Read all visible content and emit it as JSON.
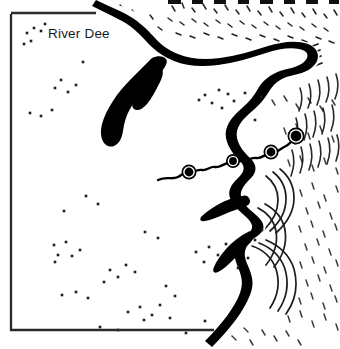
{
  "map": {
    "title_fragment": "",
    "labels": [
      {
        "text": "River Dee",
        "x": 48,
        "y": 38
      }
    ],
    "colors": {
      "ink": "#000000",
      "land": "#ffffff",
      "sea": "#ffffff",
      "frame": "#2b2b2b",
      "site_dot": "#1f1f1f"
    },
    "frame": {
      "x": 11,
      "y": 12,
      "right": 332,
      "bottom": 330
    },
    "legend": {
      "site_marker_name": "settlement-dot",
      "river_marker_name": "river-site-marker"
    },
    "river_markers": [
      {
        "id": 1,
        "x": 189,
        "y": 172,
        "r": 7.5
      },
      {
        "id": 2,
        "x": 233,
        "y": 161,
        "r": 7.0
      },
      {
        "id": 3,
        "x": 271,
        "y": 152,
        "r": 7.5
      },
      {
        "id": 4,
        "x": 296,
        "y": 136,
        "r": 8.5
      }
    ],
    "site_dots": [
      {
        "x": 27,
        "y": 33
      },
      {
        "x": 34,
        "y": 28
      },
      {
        "x": 41,
        "y": 31
      },
      {
        "x": 31,
        "y": 41
      },
      {
        "x": 45,
        "y": 24
      },
      {
        "x": 24,
        "y": 44
      },
      {
        "x": 83,
        "y": 62
      },
      {
        "x": 61,
        "y": 80
      },
      {
        "x": 76,
        "y": 85
      },
      {
        "x": 55,
        "y": 88
      },
      {
        "x": 68,
        "y": 92
      },
      {
        "x": 30,
        "y": 113
      },
      {
        "x": 41,
        "y": 116
      },
      {
        "x": 52,
        "y": 110
      },
      {
        "x": 205,
        "y": 95
      },
      {
        "x": 219,
        "y": 90
      },
      {
        "x": 228,
        "y": 94
      },
      {
        "x": 212,
        "y": 103
      },
      {
        "x": 234,
        "y": 101
      },
      {
        "x": 199,
        "y": 100
      },
      {
        "x": 222,
        "y": 108
      },
      {
        "x": 245,
        "y": 93
      },
      {
        "x": 261,
        "y": 97
      },
      {
        "x": 255,
        "y": 120
      },
      {
        "x": 54,
        "y": 245
      },
      {
        "x": 66,
        "y": 242
      },
      {
        "x": 80,
        "y": 250
      },
      {
        "x": 58,
        "y": 255
      },
      {
        "x": 72,
        "y": 256
      },
      {
        "x": 55,
        "y": 262
      },
      {
        "x": 62,
        "y": 295
      },
      {
        "x": 76,
        "y": 292
      },
      {
        "x": 88,
        "y": 298
      },
      {
        "x": 110,
        "y": 270
      },
      {
        "x": 118,
        "y": 277
      },
      {
        "x": 126,
        "y": 265
      },
      {
        "x": 135,
        "y": 272
      },
      {
        "x": 104,
        "y": 282
      },
      {
        "x": 128,
        "y": 312
      },
      {
        "x": 140,
        "y": 307
      },
      {
        "x": 152,
        "y": 315
      },
      {
        "x": 160,
        "y": 305
      },
      {
        "x": 144,
        "y": 320
      },
      {
        "x": 170,
        "y": 318
      },
      {
        "x": 118,
        "y": 330
      },
      {
        "x": 100,
        "y": 327
      },
      {
        "x": 166,
        "y": 286
      },
      {
        "x": 175,
        "y": 296
      },
      {
        "x": 196,
        "y": 252
      },
      {
        "x": 209,
        "y": 247
      },
      {
        "x": 218,
        "y": 255
      },
      {
        "x": 204,
        "y": 262
      },
      {
        "x": 226,
        "y": 244
      },
      {
        "x": 238,
        "y": 268
      },
      {
        "x": 248,
        "y": 258
      },
      {
        "x": 145,
        "y": 232
      },
      {
        "x": 158,
        "y": 238
      },
      {
        "x": 262,
        "y": 230
      },
      {
        "x": 255,
        "y": 240
      },
      {
        "x": 86,
        "y": 196
      },
      {
        "x": 98,
        "y": 204
      },
      {
        "x": 64,
        "y": 211
      },
      {
        "x": 205,
        "y": 321
      },
      {
        "x": 186,
        "y": 333
      }
    ]
  }
}
